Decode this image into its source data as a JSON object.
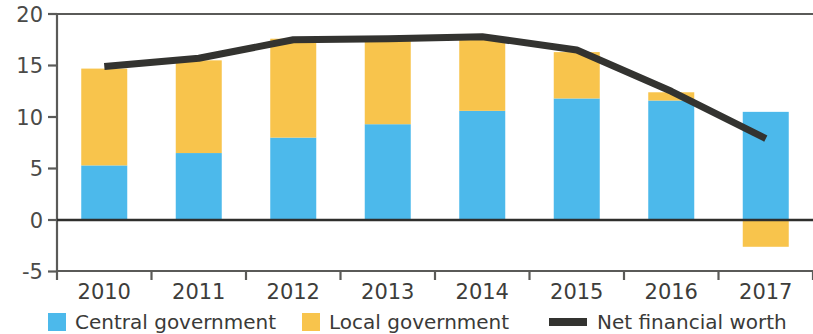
{
  "chart_data": {
    "type": "bar",
    "subtype": "stacked-bar-with-line-overlay",
    "title": "",
    "subtitle": "",
    "xlabel": "",
    "ylabel": "",
    "categories": [
      "2010",
      "2011",
      "2012",
      "2013",
      "2014",
      "2015",
      "2016",
      "2017"
    ],
    "x_tick_labels": [
      "2010",
      "2011",
      "2012",
      "2013",
      "2014",
      "2015",
      "2016",
      "2017"
    ],
    "y_tick_labels": [
      "20",
      "15",
      "10",
      "5",
      "0",
      "-5"
    ],
    "y_ticks": [
      20,
      15,
      10,
      5,
      0,
      -5
    ],
    "ylim": [
      -5,
      20
    ],
    "grid": false,
    "zero_line": true,
    "legend_position": "bottom",
    "series": [
      {
        "name": "Central government",
        "kind": "bar",
        "color": "#4cb9eb",
        "values": [
          5.3,
          6.5,
          8.0,
          9.3,
          10.6,
          11.8,
          11.6,
          10.5
        ]
      },
      {
        "name": "Local government",
        "kind": "bar",
        "color": "#f8c44c",
        "values": [
          9.4,
          9.0,
          9.6,
          8.3,
          7.1,
          4.5,
          0.8,
          -2.6
        ]
      },
      {
        "name": "Net financial worth",
        "kind": "line",
        "color": "#333330",
        "values": [
          14.9,
          15.7,
          17.5,
          17.6,
          17.8,
          16.5,
          12.5,
          7.9
        ]
      }
    ],
    "bar_totals": [
      14.7,
      15.5,
      17.6,
      17.6,
      17.7,
      16.3,
      12.4,
      10.5
    ]
  },
  "legend": {
    "items": [
      {
        "label": "Central government",
        "color": "#4cb9eb",
        "marker": "square"
      },
      {
        "label": "Local government",
        "color": "#f8c44c",
        "marker": "square"
      },
      {
        "label": "Net financial worth",
        "color": "#333330",
        "marker": "line"
      }
    ]
  },
  "axis": {
    "y_labels": [
      "20",
      "15",
      "10",
      "5",
      "0",
      "-5"
    ],
    "x_labels": [
      "2010",
      "2011",
      "2012",
      "2013",
      "2014",
      "2015",
      "2016",
      "2017"
    ]
  },
  "colors": {
    "central": "#4cb9eb",
    "local": "#f8c44c",
    "line": "#333330",
    "axis": "#5a5a58",
    "text": "#3d3d3b",
    "background": "#ffffff"
  }
}
